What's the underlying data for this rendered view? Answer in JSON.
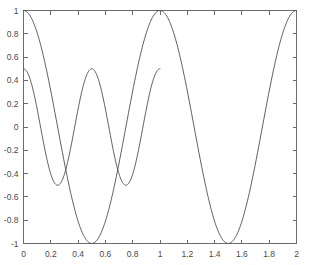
{
  "chart_data": {
    "type": "line",
    "title": "",
    "xlabel": "",
    "ylabel": "",
    "xlim": [
      0,
      2
    ],
    "ylim": [
      -1,
      1
    ],
    "grid": false,
    "legend": "none",
    "box": true,
    "ticks_all_sides": true,
    "xticks": [
      0,
      0.2,
      0.4,
      0.6,
      0.8,
      1,
      1.2,
      1.4,
      1.6,
      1.8,
      2
    ],
    "xtick_labels": [
      "0",
      "0.2",
      "0.4",
      "0.6",
      "0.8",
      "1",
      "1.2",
      "1.4",
      "1.6",
      "1.8",
      "2"
    ],
    "yticks": [
      -1,
      -0.8,
      -0.6,
      -0.4,
      -0.2,
      0,
      0.2,
      0.4,
      0.6,
      0.8,
      1
    ],
    "ytick_labels": [
      "-1",
      "-0.8",
      "-0.6",
      "-0.4",
      "-0.2",
      "0",
      "0.2",
      "0.4",
      "0.6",
      "0.8",
      "1"
    ],
    "series": [
      {
        "name": "cos(2*pi*x)",
        "color": "#4d4d4d",
        "amplitude": 1,
        "frequency": 1,
        "phase": 0,
        "x_start": 0,
        "x_end": 2,
        "samples": 400,
        "key_points": [
          {
            "x": 0,
            "y": 1
          },
          {
            "x": 0.25,
            "y": 0
          },
          {
            "x": 0.5,
            "y": -1
          },
          {
            "x": 0.75,
            "y": 0
          },
          {
            "x": 1,
            "y": 1
          },
          {
            "x": 1.25,
            "y": 0
          },
          {
            "x": 1.5,
            "y": -1
          },
          {
            "x": 1.75,
            "y": 0
          },
          {
            "x": 2,
            "y": 1
          }
        ]
      },
      {
        "name": "0.5*cos(4*pi*x)",
        "color": "#4d4d4d",
        "amplitude": 0.5,
        "frequency": 2,
        "phase": 0,
        "x_start": 0,
        "x_end": 1,
        "samples": 300,
        "key_points": [
          {
            "x": 0,
            "y": 0.5
          },
          {
            "x": 0.125,
            "y": 0
          },
          {
            "x": 0.25,
            "y": -0.5
          },
          {
            "x": 0.375,
            "y": 0
          },
          {
            "x": 0.5,
            "y": 0.5
          },
          {
            "x": 0.625,
            "y": 0
          },
          {
            "x": 0.75,
            "y": -0.5
          },
          {
            "x": 0.875,
            "y": 0
          },
          {
            "x": 1,
            "y": 0.5
          }
        ]
      }
    ]
  },
  "figure": {
    "background": "#ffffff",
    "axis_color": "#6b6b6b",
    "tick_label_color": "#4a4a4a"
  }
}
